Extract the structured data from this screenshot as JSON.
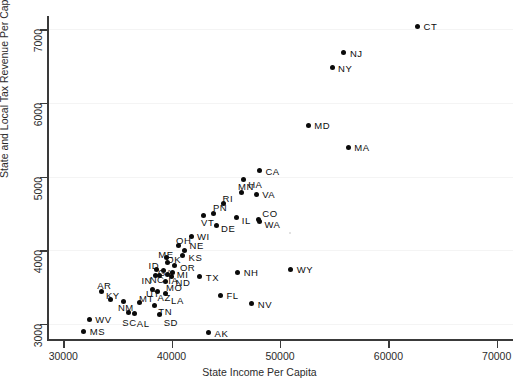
{
  "chart_data": {
    "type": "scatter",
    "title": "",
    "xlabel": "State Income Per Capita",
    "ylabel": "State and Local Tax Revenue Per Capita",
    "xlim": [
      28500,
      71500
    ],
    "ylim": [
      2780,
      7180
    ],
    "xticks": [
      30000,
      40000,
      50000,
      60000,
      70000
    ],
    "yticks": [
      3000,
      4000,
      5000,
      6000,
      7000
    ],
    "xtick_labels": [
      "30000",
      "40000",
      "50000",
      "60000",
      "70000"
    ],
    "ytick_labels": [
      "3000",
      "4000",
      "5000",
      "6000",
      "7000"
    ],
    "grid": true,
    "grid_axis": "y",
    "legend": "none",
    "point_color": "#0a0a0a",
    "point_label_position": "right",
    "points": [
      {
        "label": "CT",
        "x": 62700,
        "y": 7040
      },
      {
        "label": "NJ",
        "x": 55900,
        "y": 6680
      },
      {
        "label": "NY",
        "x": 54800,
        "y": 6480
      },
      {
        "label": "MD",
        "x": 52600,
        "y": 5700
      },
      {
        "label": "MA",
        "x": 56300,
        "y": 5400
      },
      {
        "label": "CA",
        "x": 48100,
        "y": 5080
      },
      {
        "label": "HA",
        "x": 46600,
        "y": 4960
      },
      {
        "label": "MN",
        "x": 46400,
        "y": 4780
      },
      {
        "label": "VA",
        "x": 47800,
        "y": 4760
      },
      {
        "label": "RI",
        "x": 44800,
        "y": 4630
      },
      {
        "label": "PN",
        "x": 43900,
        "y": 4500
      },
      {
        "label": "VT",
        "x": 42900,
        "y": 4470
      },
      {
        "label": "IL",
        "x": 46000,
        "y": 4440
      },
      {
        "label": "CO",
        "x": 48000,
        "y": 4420
      },
      {
        "label": "WA",
        "x": 48100,
        "y": 4390
      },
      {
        "label": "DE",
        "x": 44100,
        "y": 4340
      },
      {
        "label": "WI",
        "x": 41800,
        "y": 4180
      },
      {
        "label": "OH",
        "x": 40600,
        "y": 4070
      },
      {
        "label": "NE",
        "x": 41200,
        "y": 4000
      },
      {
        "label": "KS",
        "x": 41000,
        "y": 3930
      },
      {
        "label": "ME",
        "x": 39500,
        "y": 3900
      },
      {
        "label": "OK",
        "x": 39600,
        "y": 3830
      },
      {
        "label": "OR",
        "x": 40300,
        "y": 3790
      },
      {
        "label": "ID",
        "x": 38600,
        "y": 3740
      },
      {
        "label": "GA",
        "x": 39200,
        "y": 3720
      },
      {
        "label": "MI",
        "x": 40100,
        "y": 3700
      },
      {
        "label": "IA",
        "x": 39600,
        "y": 3670
      },
      {
        "label": "NC",
        "x": 38900,
        "y": 3660
      },
      {
        "label": "IN",
        "x": 38500,
        "y": 3650
      },
      {
        "label": "ND",
        "x": 40000,
        "y": 3640
      },
      {
        "label": "TX",
        "x": 42600,
        "y": 3640
      },
      {
        "label": "NH",
        "x": 46100,
        "y": 3700
      },
      {
        "label": "WY",
        "x": 51000,
        "y": 3740
      },
      {
        "label": "MO",
        "x": 39400,
        "y": 3580
      },
      {
        "label": "AR",
        "x": 33500,
        "y": 3440
      },
      {
        "label": "UT",
        "x": 38200,
        "y": 3470
      },
      {
        "label": "AZ",
        "x": 38700,
        "y": 3440
      },
      {
        "label": "LA",
        "x": 39400,
        "y": 3410
      },
      {
        "label": "FL",
        "x": 44500,
        "y": 3390
      },
      {
        "label": "KY",
        "x": 34400,
        "y": 3330
      },
      {
        "label": "NM",
        "x": 35600,
        "y": 3300
      },
      {
        "label": "MT",
        "x": 37000,
        "y": 3290
      },
      {
        "label": "NV",
        "x": 47400,
        "y": 3270
      },
      {
        "label": "TN",
        "x": 38400,
        "y": 3250
      },
      {
        "label": "SC",
        "x": 36000,
        "y": 3150
      },
      {
        "label": "AL",
        "x": 36600,
        "y": 3140
      },
      {
        "label": "SD",
        "x": 38900,
        "y": 3130
      },
      {
        "label": "WV",
        "x": 32400,
        "y": 3060
      },
      {
        "label": "MS",
        "x": 31900,
        "y": 2900
      },
      {
        "label": "AK",
        "x": 43400,
        "y": 2880
      }
    ]
  },
  "axes": {
    "x_label": "State Income Per Capita",
    "y_label": "State and Local Tax Revenue Per Capita"
  },
  "title": {
    "text": ""
  }
}
